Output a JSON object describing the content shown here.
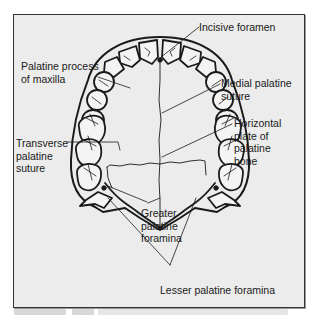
{
  "figure": {
    "labels": {
      "incisive_foramen": "Incisive foramen",
      "palatine_process": "Palatine process\nof maxilla",
      "medial_palatine_suture": "Medial palatine\nsuture",
      "horizontal_plate": "Horizontal\nplate of\npalatine\nbone",
      "transverse_palatine_suture": "Transverse\npalatine\nsuture",
      "greater_palatine_foramina": "Greater\npalatine\nforamina",
      "lesser_palatine_foramina": "Lesser palatine foramina"
    }
  },
  "colors": {
    "panel_bg": "#ececec",
    "line": "#1a1a1a",
    "tooth_fill": "#f4f4f4"
  }
}
